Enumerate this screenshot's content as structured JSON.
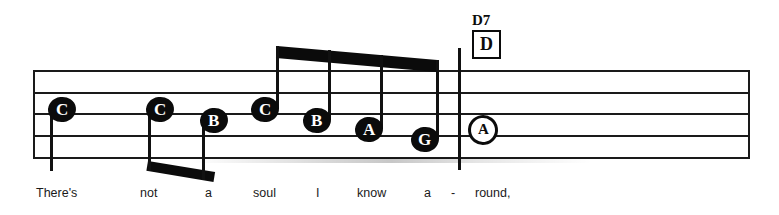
{
  "sheet": {
    "staff": {
      "left": 33,
      "right": 750,
      "line_ys": [
        70,
        92,
        113,
        135,
        157
      ],
      "line_count": 5
    },
    "barline": {
      "x": 458
    }
  },
  "chord": {
    "name": "D7",
    "diagram_label": "D"
  },
  "notes": [
    {
      "letter": "C",
      "x": 48,
      "y": 97,
      "style": "filled",
      "stem": "down",
      "beamed": false
    },
    {
      "letter": "C",
      "x": 146,
      "y": 97,
      "style": "filled",
      "stem": "down",
      "beamed": true
    },
    {
      "letter": "B",
      "x": 200,
      "y": 108,
      "style": "filled",
      "stem": "down",
      "beamed": true
    },
    {
      "letter": "C",
      "x": 251,
      "y": 97,
      "style": "filled",
      "stem": "up",
      "beamed": true
    },
    {
      "letter": "B",
      "x": 303,
      "y": 108,
      "style": "filled",
      "stem": "up",
      "beamed": true
    },
    {
      "letter": "A",
      "x": 355,
      "y": 117,
      "style": "filled",
      "stem": "up",
      "beamed": true
    },
    {
      "letter": "G",
      "x": 411,
      "y": 127,
      "style": "filled",
      "stem": "up",
      "beamed": true
    },
    {
      "letter": "A",
      "x": 468,
      "y": 115,
      "style": "hollow",
      "stem": "none",
      "beamed": false
    }
  ],
  "beams": [
    {
      "name": "upper-beam",
      "x1": 277,
      "y1": 46,
      "x2": 437,
      "y2": 60,
      "thickness": 12
    },
    {
      "name": "lower-beam",
      "x1": 148,
      "y1": 161,
      "x2": 215,
      "y2": 172,
      "thickness": 10
    }
  ],
  "lyrics": [
    {
      "text": "There's",
      "x": 36
    },
    {
      "text": "not",
      "x": 140
    },
    {
      "text": "a",
      "x": 205
    },
    {
      "text": "soul",
      "x": 253
    },
    {
      "text": "I",
      "x": 316
    },
    {
      "text": "know",
      "x": 357
    },
    {
      "text": "a",
      "x": 424
    },
    {
      "text": "-",
      "x": 451
    },
    {
      "text": "round,",
      "x": 475
    }
  ],
  "colors": {
    "ink": "#0b0b0b",
    "staff": "#1a1a1a",
    "paper": "#ffffff"
  }
}
